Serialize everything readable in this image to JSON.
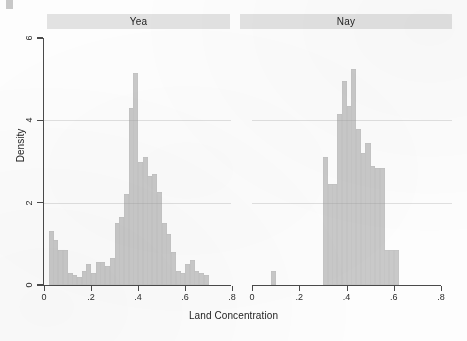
{
  "figure": {
    "x_axis_title": "Land Concentration",
    "y_axis_title": "Density",
    "bar_color": "#c9c9c9",
    "axis_color": "#4a4a4a",
    "panel_header_bg": "#e2e2e2"
  },
  "panels": [
    {
      "id": "yea",
      "label": "Yea"
    },
    {
      "id": "nay",
      "label": "Nay"
    }
  ],
  "chart_data": {
    "type": "bar",
    "title": "",
    "subtitle": "",
    "xlabel": "Land Concentration",
    "ylabel": "Density",
    "xlim": [
      0,
      0.8
    ],
    "ylim": [
      0,
      6
    ],
    "xticks": [
      0,
      0.2,
      0.4,
      0.6,
      0.8
    ],
    "xtick_labels": [
      "0",
      ".2",
      ".4",
      ".6",
      ".8"
    ],
    "yticks": [
      0,
      2,
      4,
      6
    ],
    "ytick_labels": [
      "0",
      "2",
      "4",
      "6"
    ],
    "grid": true,
    "grid_axis": "y",
    "legend": "none",
    "facets": [
      "Yea",
      "Nay"
    ],
    "bin_width": 0.02,
    "series": [
      {
        "name": "Yea",
        "facet": "Yea",
        "bin_starts": [
          0.02,
          0.04,
          0.06,
          0.08,
          0.1,
          0.12,
          0.14,
          0.16,
          0.18,
          0.2,
          0.22,
          0.24,
          0.26,
          0.28,
          0.3,
          0.32,
          0.34,
          0.36,
          0.38,
          0.4,
          0.42,
          0.44,
          0.46,
          0.48,
          0.5,
          0.52,
          0.54,
          0.56,
          0.58,
          0.6,
          0.62,
          0.64,
          0.66,
          0.68
        ],
        "values": [
          1.3,
          1.1,
          0.85,
          0.85,
          0.3,
          0.25,
          0.2,
          0.35,
          0.5,
          0.3,
          0.55,
          0.55,
          0.45,
          0.65,
          1.5,
          1.65,
          2.2,
          4.3,
          5.15,
          3.0,
          3.1,
          2.65,
          2.7,
          2.25,
          1.5,
          1.25,
          0.8,
          0.35,
          0.3,
          0.5,
          0.6,
          0.35,
          0.3,
          0.25
        ]
      },
      {
        "name": "Nay",
        "facet": "Nay",
        "bin_starts": [
          0.08,
          0.3,
          0.32,
          0.34,
          0.36,
          0.38,
          0.4,
          0.42,
          0.44,
          0.46,
          0.48,
          0.5,
          0.52,
          0.54,
          0.56,
          0.58,
          0.6
        ],
        "values": [
          0.35,
          3.1,
          2.45,
          2.45,
          4.15,
          4.95,
          4.35,
          5.25,
          3.8,
          3.2,
          3.45,
          2.9,
          2.85,
          2.85,
          0.85,
          0.85,
          0.85
        ]
      }
    ]
  }
}
